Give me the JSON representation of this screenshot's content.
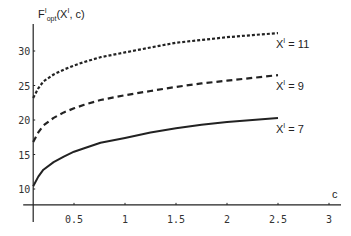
{
  "chart_data": {
    "type": "line",
    "title": "",
    "ylabel": "F^I_opt(X^I, c)",
    "ylabel_parts": {
      "main": "F",
      "sup": "I",
      "sub": "opt",
      "args_pre": "(X",
      "args_sup": "I",
      "args_post": ", c)"
    },
    "xlabel": "c",
    "xlim": [
      0.1,
      3.1
    ],
    "ylim": [
      7.7,
      33.5
    ],
    "axes_origin": [
      0.1,
      7.7
    ],
    "x_ticks": [
      0.5,
      1,
      1.5,
      2,
      2.5,
      3
    ],
    "x_tick_labels": [
      "0.5",
      "1",
      "1.5",
      "2",
      "2.5",
      "3"
    ],
    "y_ticks": [
      10,
      15,
      20,
      25,
      30
    ],
    "y_tick_labels": [
      "10",
      "15",
      "20",
      "25",
      "30"
    ],
    "grid": false,
    "legend": "inline labels at curve ends",
    "series": [
      {
        "name": "X^I = 11",
        "label_main": "X",
        "label_sup": "I",
        "label_rest": " = 11",
        "style": "dotted",
        "color": "#222222",
        "x": [
          0.1,
          0.15,
          0.2,
          0.3,
          0.4,
          0.5,
          0.6,
          0.76,
          1.0,
          1.25,
          1.5,
          1.75,
          2.0,
          2.25,
          2.5
        ],
        "values": [
          23.2,
          24.6,
          25.6,
          26.6,
          27.3,
          27.9,
          28.4,
          29.1,
          29.8,
          30.5,
          31.2,
          31.6,
          32.0,
          32.3,
          32.6
        ]
      },
      {
        "name": "X^I = 9",
        "label_main": "X",
        "label_sup": "I",
        "label_rest": " = 9",
        "style": "dashed",
        "color": "#222222",
        "x": [
          0.1,
          0.15,
          0.2,
          0.3,
          0.4,
          0.5,
          0.6,
          0.76,
          1.0,
          1.25,
          1.5,
          1.75,
          2.0,
          2.25,
          2.5
        ],
        "values": [
          16.8,
          18.2,
          19.2,
          20.3,
          21.1,
          21.7,
          22.2,
          22.9,
          23.6,
          24.2,
          24.8,
          25.3,
          25.7,
          26.1,
          26.5
        ]
      },
      {
        "name": "X^I = 7",
        "label_main": "X",
        "label_sup": "I",
        "label_rest": " = 7",
        "style": "solid",
        "color": "#222222",
        "x": [
          0.1,
          0.15,
          0.2,
          0.3,
          0.4,
          0.5,
          0.6,
          0.76,
          1.0,
          1.25,
          1.5,
          1.75,
          2.0,
          2.25,
          2.5
        ],
        "values": [
          10.4,
          11.8,
          12.8,
          13.9,
          14.7,
          15.4,
          15.9,
          16.7,
          17.4,
          18.2,
          18.8,
          19.3,
          19.7,
          20.0,
          20.3
        ]
      }
    ]
  }
}
